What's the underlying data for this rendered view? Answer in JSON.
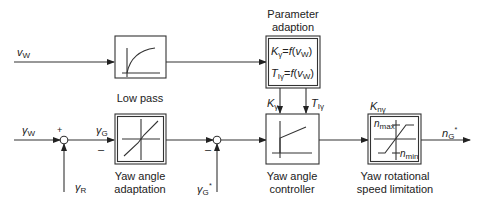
{
  "diagram": {
    "type": "control block diagram",
    "blocks": {
      "low_pass": {
        "label": "Low pass",
        "icon": "first-order-step-response"
      },
      "parameter_adaption": {
        "title_line1": "Parameter",
        "title_line2": "adaption",
        "formula1": {
          "lhs": "K",
          "lhs_sub": "γ",
          "eq": "=",
          "fn": "f",
          "arg": "v",
          "arg_sub": "W"
        },
        "formula2": {
          "lhs": "T",
          "lhs_sub": "Iγ",
          "eq": "=",
          "fn": "f",
          "arg": "v",
          "arg_sub": "W"
        }
      },
      "yaw_angle_adaptation": {
        "label_line1": "Yaw angle",
        "label_line2": "adaptation",
        "icon": "dead-zone-characteristic"
      },
      "yaw_angle_controller": {
        "label_line1": "Yaw angle",
        "label_line2": "controller",
        "icon": "pi-step-response"
      },
      "yaw_speed_limitation": {
        "label_line1": "Yaw rotational",
        "label_line2": "speed limitation",
        "icon": "saturation-characteristic",
        "n_max": {
          "sym": "n",
          "sub": "max"
        },
        "n_min": {
          "sym": "n",
          "sub": "min"
        }
      }
    },
    "signals": {
      "v_w": {
        "sym": "v",
        "sub": "W"
      },
      "gamma_w": {
        "sym": "γ",
        "sub": "W"
      },
      "gamma_r": {
        "sym": "γ",
        "sub": "R"
      },
      "gamma_g": {
        "sym": "γ",
        "sub": "G"
      },
      "gamma_g_star": {
        "sym": "γ",
        "sub": "G",
        "sup": "*"
      },
      "k_gamma": {
        "sym": "K",
        "sub": "γ"
      },
      "t_i_gamma": {
        "sym": "T",
        "sub": "Iγ"
      },
      "k_n_gamma": {
        "sym": "K",
        "sub": "nγ"
      },
      "n_g_star": {
        "sym": "n",
        "sub": "G",
        "sup": "*"
      }
    },
    "summing_junctions": {
      "sum1": {
        "plus": "+",
        "minus": "–"
      },
      "sum2": {
        "minus": "–"
      }
    }
  }
}
